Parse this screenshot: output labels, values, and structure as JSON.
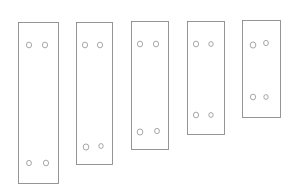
{
  "canvas": {
    "width": 296,
    "height": 184,
    "background": "#ffffff",
    "stroke_color": "#8a8a8a"
  },
  "sketch": {
    "description": "Pencil sketch of five vertical rectangular plates, decreasing in height left to right, each with four mounting holes (two near top, two near bottom)",
    "plates": [
      {
        "id": 1,
        "x": 18,
        "y": 22,
        "w": 40,
        "h": 161,
        "holes": [
          {
            "cx": 29,
            "cy": 45,
            "r": 2.6
          },
          {
            "cx": 45,
            "cy": 45,
            "r": 2.6
          },
          {
            "cx": 29,
            "cy": 163,
            "r": 2.4
          },
          {
            "cx": 46,
            "cy": 163,
            "r": 2.6
          }
        ]
      },
      {
        "id": 2,
        "x": 76,
        "y": 22,
        "w": 36,
        "h": 142,
        "holes": [
          {
            "cx": 85,
            "cy": 45,
            "r": 2.6
          },
          {
            "cx": 100,
            "cy": 45,
            "r": 2.6
          },
          {
            "cx": 86,
            "cy": 147,
            "r": 2.8
          },
          {
            "cx": 101,
            "cy": 146,
            "r": 2.2
          }
        ]
      },
      {
        "id": 3,
        "x": 131,
        "y": 21,
        "w": 37,
        "h": 128,
        "holes": [
          {
            "cx": 140,
            "cy": 44,
            "r": 2.6
          },
          {
            "cx": 156,
            "cy": 44,
            "r": 2.6
          },
          {
            "cx": 140,
            "cy": 132,
            "r": 2.8
          },
          {
            "cx": 157,
            "cy": 131,
            "r": 2.4
          }
        ]
      },
      {
        "id": 4,
        "x": 187,
        "y": 21,
        "w": 37,
        "h": 113,
        "holes": [
          {
            "cx": 196,
            "cy": 44,
            "r": 2.6
          },
          {
            "cx": 211,
            "cy": 44,
            "r": 2.2
          },
          {
            "cx": 196,
            "cy": 115,
            "r": 2.6
          },
          {
            "cx": 211,
            "cy": 115,
            "r": 2.2
          }
        ]
      },
      {
        "id": 5,
        "x": 242,
        "y": 20,
        "w": 38,
        "h": 97,
        "holes": [
          {
            "cx": 253,
            "cy": 45,
            "r": 2.8
          },
          {
            "cx": 266,
            "cy": 43,
            "r": 2.4
          },
          {
            "cx": 253,
            "cy": 97,
            "r": 2.6
          },
          {
            "cx": 266,
            "cy": 97,
            "r": 2.2
          }
        ]
      }
    ]
  }
}
